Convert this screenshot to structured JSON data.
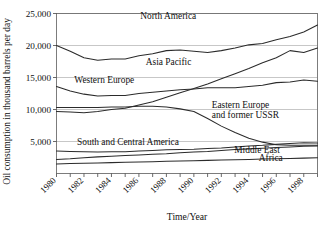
{
  "chart_data": {
    "type": "line",
    "title": "",
    "xlabel": "Time/Year",
    "ylabel": "Oil consumption in thousand barrels per day",
    "xlim": [
      1980,
      1999
    ],
    "ylim": [
      0,
      25000
    ],
    "yticks": [
      0,
      5000,
      10000,
      15000,
      20000,
      25000
    ],
    "ytick_labels": [
      "",
      "5,000",
      "10,000",
      "15,000",
      "20,000",
      "25,000"
    ],
    "xticks": [
      1980,
      1981,
      1982,
      1983,
      1984,
      1985,
      1986,
      1987,
      1988,
      1989,
      1990,
      1991,
      1992,
      1993,
      1994,
      1995,
      1996,
      1997,
      1998,
      1999
    ],
    "xtick_labels": [
      "1980",
      "1982",
      "1984",
      "1986",
      "1988",
      "1990",
      "1992",
      "1994",
      "1996",
      "1998"
    ],
    "xtick_label_years": [
      1980,
      1982,
      1984,
      1986,
      1988,
      1990,
      1992,
      1994,
      1996,
      1998
    ],
    "grid": true,
    "legend_position": "inline-labels",
    "x": [
      1980,
      1981,
      1982,
      1983,
      1984,
      1985,
      1986,
      1987,
      1988,
      1989,
      1990,
      1991,
      1992,
      1993,
      1994,
      1995,
      1996,
      1997,
      1998,
      1999
    ],
    "series": [
      {
        "name": "North America",
        "label": "North America",
        "label_x": 1986.1,
        "label_y": 24100,
        "values": [
          20000,
          19100,
          18100,
          17700,
          17900,
          17900,
          18400,
          18700,
          19200,
          19300,
          19100,
          18900,
          19200,
          19600,
          20100,
          20300,
          20900,
          21400,
          22100,
          23200
        ]
      },
      {
        "name": "Asia Pacific",
        "label": "Asia Pacific",
        "label_x": 1986.5,
        "label_y": 17000,
        "values": [
          9700,
          9600,
          9500,
          9700,
          10000,
          10200,
          10700,
          11200,
          11900,
          12600,
          13300,
          14000,
          14800,
          15600,
          16400,
          17300,
          18100,
          19200,
          18900,
          19600
        ]
      },
      {
        "name": "Western Europe",
        "label": "Western Europe",
        "label_x": 1981.3,
        "label_y": 14200,
        "values": [
          13600,
          12900,
          12400,
          12100,
          12200,
          12200,
          12500,
          12700,
          12900,
          13100,
          13200,
          13400,
          13400,
          13400,
          13600,
          13800,
          14200,
          14300,
          14600,
          14400
        ]
      },
      {
        "name": "Eastern Europe and former USSR",
        "label": "Eastern Europe",
        "label2": "and former USSR",
        "label_x": 1991.3,
        "label_y": 10200,
        "label2_y": 8700,
        "values": [
          10300,
          10300,
          10300,
          10300,
          10400,
          10400,
          10500,
          10500,
          10400,
          10100,
          9700,
          8600,
          7400,
          6400,
          5500,
          4900,
          4500,
          4400,
          4400,
          4400
        ]
      },
      {
        "name": "South and Central America",
        "label": "South and Central America",
        "label_x": 1981.5,
        "label_y": 4450,
        "values": [
          3500,
          3450,
          3400,
          3350,
          3400,
          3400,
          3500,
          3600,
          3700,
          3750,
          3800,
          3900,
          4000,
          4150,
          4300,
          4400,
          4550,
          4700,
          4800,
          4750
        ]
      },
      {
        "name": "Middle East",
        "label": "Middle East",
        "label_x": 1994.6,
        "label_y": 3150,
        "values": [
          2200,
          2300,
          2450,
          2600,
          2700,
          2800,
          2900,
          3000,
          3100,
          3250,
          3350,
          3450,
          3600,
          3750,
          3850,
          3950,
          4050,
          4150,
          4250,
          4300
        ]
      },
      {
        "name": "Africa",
        "label": "Africa",
        "label_x": 1995.6,
        "label_y": 1950,
        "values": [
          1500,
          1550,
          1600,
          1650,
          1700,
          1750,
          1800,
          1850,
          1900,
          1950,
          2000,
          2050,
          2100,
          2150,
          2200,
          2250,
          2300,
          2350,
          2400,
          2450
        ]
      }
    ]
  },
  "colors": {
    "series_stroke": "#2b2b2b",
    "gridline": "#b9b9b9",
    "frame": "#6f6f6f",
    "background": "#ffffff"
  }
}
